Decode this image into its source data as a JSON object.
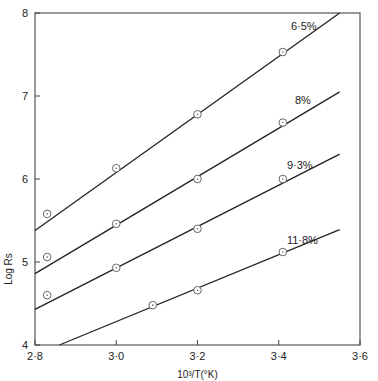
{
  "chart_data": {
    "type": "line",
    "title": "",
    "xlabel": "10³/T(°K)",
    "ylabel": "Log Rs",
    "xlim": [
      2.8,
      3.6
    ],
    "ylim": [
      4,
      8
    ],
    "x_ticks": [
      "2·8",
      "3·0",
      "3·2",
      "3·4",
      "3·6"
    ],
    "x_tick_values": [
      2.8,
      3.0,
      3.2,
      3.4,
      3.6
    ],
    "y_ticks": [
      "4",
      "5",
      "6",
      "7",
      "8"
    ],
    "y_tick_values": [
      4,
      5,
      6,
      7,
      8
    ],
    "grid": false,
    "legend": "inline labels at line ends",
    "series": [
      {
        "name": "6·5%",
        "points": [
          [
            2.83,
            5.58
          ],
          [
            3.0,
            6.13
          ],
          [
            3.2,
            6.78
          ],
          [
            3.41,
            7.53
          ]
        ],
        "fit": [
          [
            2.8,
            5.38
          ],
          [
            3.55,
            8.0
          ]
        ]
      },
      {
        "name": "8%",
        "points": [
          [
            2.83,
            5.06
          ],
          [
            3.0,
            5.46
          ],
          [
            3.2,
            6.0
          ],
          [
            3.41,
            6.68
          ]
        ],
        "fit": [
          [
            2.8,
            4.86
          ],
          [
            3.55,
            7.05
          ]
        ]
      },
      {
        "name": "9·3%",
        "points": [
          [
            2.83,
            4.6
          ],
          [
            3.0,
            4.93
          ],
          [
            3.2,
            5.4
          ],
          [
            3.41,
            6.0
          ]
        ],
        "fit": [
          [
            2.8,
            4.43
          ],
          [
            3.55,
            6.3
          ]
        ]
      },
      {
        "name": "11·8%",
        "points": [
          [
            3.09,
            4.48
          ],
          [
            3.2,
            4.66
          ],
          [
            3.41,
            5.12
          ]
        ],
        "fit": [
          [
            2.86,
            4.0
          ],
          [
            3.55,
            5.39
          ]
        ]
      }
    ]
  }
}
